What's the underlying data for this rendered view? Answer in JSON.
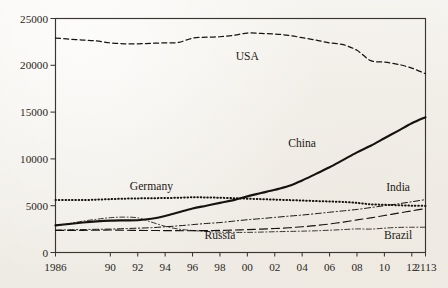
{
  "chart_data": {
    "type": "line",
    "title": "",
    "subtitle": "",
    "xlabel": "",
    "ylabel": "",
    "xlim": [
      1986,
      2013
    ],
    "ylim": [
      0,
      25000
    ],
    "grid": false,
    "legend_position": "inline-annotations",
    "y_ticks": [
      "0",
      "5000",
      "10000",
      "15000",
      "20000",
      "25000"
    ],
    "y_tick_values": [
      0,
      5000,
      10000,
      15000,
      20000,
      25000
    ],
    "x_ticks": [
      "1986",
      "90",
      "92",
      "94",
      "96",
      "98",
      "00",
      "02",
      "04",
      "06",
      "08",
      "10",
      "12",
      "2113"
    ],
    "x_tick_values": [
      1986,
      1990,
      1992,
      1994,
      1996,
      1998,
      2000,
      2002,
      2004,
      2006,
      2008,
      2010,
      2012,
      2013
    ],
    "x": [
      1986,
      1987,
      1988,
      1989,
      1990,
      1991,
      1992,
      1993,
      1994,
      1995,
      1996,
      1997,
      1998,
      1999,
      2000,
      2001,
      2002,
      2003,
      2004,
      2005,
      2006,
      2007,
      2008,
      2009,
      2010,
      2011,
      2012,
      2013
    ],
    "series": [
      {
        "name": "USA",
        "style": "dashed",
        "label_x": 2000,
        "label_y": 20600,
        "values": [
          22900,
          22800,
          22700,
          22600,
          22400,
          22300,
          22300,
          22350,
          22400,
          22450,
          22900,
          23000,
          23050,
          23200,
          23450,
          23400,
          23350,
          23200,
          22950,
          22700,
          22400,
          22200,
          21600,
          20500,
          20350,
          20100,
          19700,
          19100
        ]
      },
      {
        "name": "China",
        "style": "solid",
        "label_x": 2004,
        "label_y": 11300,
        "values": [
          2900,
          3050,
          3200,
          3320,
          3400,
          3430,
          3450,
          3600,
          3900,
          4300,
          4700,
          5000,
          5300,
          5600,
          6000,
          6350,
          6700,
          7100,
          7700,
          8400,
          9100,
          9900,
          10700,
          11400,
          12200,
          13000,
          13800,
          14450
        ]
      },
      {
        "name": "Germany",
        "style": "dotted",
        "label_x": 1993,
        "label_y": 6650,
        "values": [
          5600,
          5620,
          5600,
          5650,
          5700,
          5750,
          5780,
          5800,
          5820,
          5850,
          5900,
          5880,
          5850,
          5800,
          5750,
          5700,
          5650,
          5600,
          5550,
          5500,
          5450,
          5400,
          5300,
          5150,
          5100,
          5050,
          5000,
          4980
        ]
      },
      {
        "name": "India",
        "style": "dashdot",
        "label_x": 2011,
        "label_y": 6550,
        "values": [
          2400,
          2420,
          2450,
          2480,
          2500,
          2550,
          2600,
          2650,
          2750,
          2850,
          2980,
          3100,
          3200,
          3350,
          3500,
          3620,
          3750,
          3880,
          4000,
          4150,
          4300,
          4450,
          4600,
          4800,
          5000,
          5200,
          5420,
          5650
        ]
      },
      {
        "name": "Russia",
        "style": "dashdot-fine",
        "label_x": 1998,
        "label_y": 1400,
        "values": [
          2900,
          3100,
          3350,
          3550,
          3720,
          3780,
          3700,
          3250,
          2800,
          2500,
          2350,
          2250,
          2180,
          2150,
          2150,
          2180,
          2220,
          2250,
          2280,
          2320,
          2380,
          2450,
          2520,
          2500,
          2600,
          2680,
          2700,
          2700
        ]
      },
      {
        "name": "Brazil",
        "style": "longdash",
        "label_x": 2011,
        "label_y": 1400,
        "values": [
          2350,
          2360,
          2370,
          2380,
          2400,
          2380,
          2360,
          2350,
          2340,
          2330,
          2330,
          2340,
          2360,
          2400,
          2450,
          2500,
          2560,
          2640,
          2750,
          2880,
          3050,
          3250,
          3480,
          3700,
          3950,
          4200,
          4450,
          4700
        ]
      }
    ]
  },
  "colors": {
    "ink": "#16130f",
    "axis": "#3a352e",
    "paper": "#f4f2ee"
  }
}
